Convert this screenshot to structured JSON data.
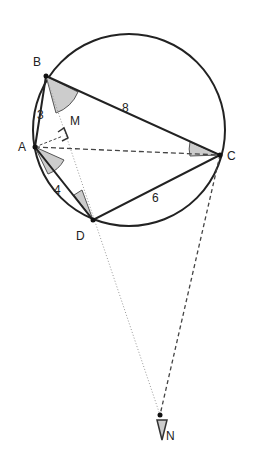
{
  "points": {
    "A": {
      "label": "A",
      "x": 35,
      "y": 147
    },
    "B": {
      "label": "B",
      "x": 46,
      "y": 76
    },
    "C": {
      "label": "C",
      "x": 220,
      "y": 155
    },
    "D": {
      "label": "D",
      "x": 93,
      "y": 220
    },
    "M": {
      "label": "M",
      "x": 63,
      "y": 136
    },
    "N": {
      "label": "N",
      "x": 160,
      "y": 415
    }
  },
  "lengths": {
    "AB": "3",
    "BC": "8",
    "CD": "6",
    "DA": "4"
  },
  "colors": {
    "line": "#222222",
    "angle_fill": "#cccccc",
    "dashed": "#444444"
  }
}
